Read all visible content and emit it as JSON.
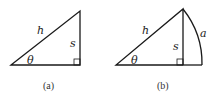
{
  "figures": [
    {
      "id": "a",
      "caption": "(a)",
      "labels": {
        "hypotenuse": "h",
        "opposite": "s",
        "angle": "θ"
      },
      "shape": "right-triangle"
    },
    {
      "id": "b",
      "caption": "(b)",
      "labels": {
        "hypotenuse": "h",
        "opposite": "s",
        "angle": "θ",
        "arc": "a"
      },
      "shape": "right-triangle-with-circular-arc"
    }
  ],
  "colors": {
    "stroke": "#1a1a1a",
    "text": "#222222"
  }
}
